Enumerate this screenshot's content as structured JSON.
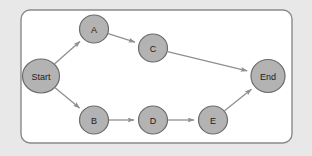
{
  "canvas": {
    "width": 312,
    "height": 156,
    "background_color": "#e8e8e8"
  },
  "container": {
    "name": "diagram-frame",
    "x": 21,
    "y": 10,
    "width": 271,
    "height": 133,
    "corner_radius": 9,
    "fill_color": "#ffffff",
    "stroke_color": "#8a8a8a",
    "stroke_width": 1.4
  },
  "style": {
    "node_fill": "#b3b3b3",
    "node_stroke": "#6b6b6b",
    "node_stroke_width": 1.2,
    "node_text_color": "#1c1c1c",
    "edge_color": "#8f8f8f",
    "edge_width": 1.3,
    "arrowhead_color": "#8f8f8f"
  },
  "graph": {
    "type": "flowchart",
    "direction": "left-to-right",
    "nodes": [
      {
        "id": "start",
        "label": "Start",
        "cx": 41,
        "cy": 76,
        "rx": 18.5,
        "ry": 17,
        "font_size": 9
      },
      {
        "id": "a",
        "label": "A",
        "cx": 94,
        "cy": 29,
        "rx": 14.5,
        "ry": 14,
        "font_size": 9
      },
      {
        "id": "c",
        "label": "C",
        "cx": 153,
        "cy": 48,
        "rx": 14.5,
        "ry": 14,
        "font_size": 9
      },
      {
        "id": "b",
        "label": "B",
        "cx": 94,
        "cy": 120,
        "rx": 14.5,
        "ry": 14,
        "font_size": 9
      },
      {
        "id": "d",
        "label": "D",
        "cx": 153,
        "cy": 120,
        "rx": 14.5,
        "ry": 14,
        "font_size": 9
      },
      {
        "id": "e",
        "label": "E",
        "cx": 213,
        "cy": 120,
        "rx": 14.5,
        "ry": 14,
        "font_size": 9
      },
      {
        "id": "end",
        "label": "End",
        "cx": 268,
        "cy": 76,
        "rx": 17,
        "ry": 16.5,
        "font_size": 9
      }
    ],
    "edges": [
      {
        "id": "start-a",
        "from": "start",
        "to": "a",
        "label": ""
      },
      {
        "id": "a-c",
        "from": "a",
        "to": "c",
        "label": ""
      },
      {
        "id": "c-end",
        "from": "c",
        "to": "end",
        "label": ""
      },
      {
        "id": "start-b",
        "from": "start",
        "to": "b",
        "label": ""
      },
      {
        "id": "b-d",
        "from": "b",
        "to": "d",
        "label": ""
      },
      {
        "id": "d-e",
        "from": "d",
        "to": "e",
        "label": ""
      },
      {
        "id": "e-end",
        "from": "e",
        "to": "end",
        "label": ""
      }
    ]
  }
}
